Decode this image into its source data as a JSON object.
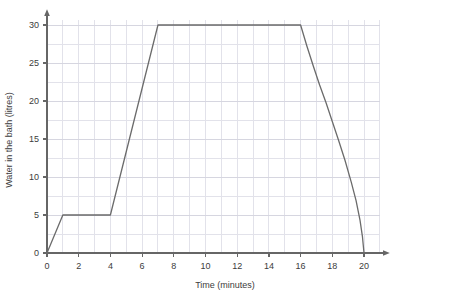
{
  "chart_data": {
    "type": "line",
    "title": "",
    "xlabel": "Time (minutes)",
    "ylabel": "Water in the bath (litres)",
    "xlim": [
      0,
      21
    ],
    "ylim": [
      0,
      31
    ],
    "grid": true,
    "legend": null,
    "xticks": [
      0,
      2,
      4,
      6,
      8,
      10,
      12,
      14,
      16,
      18,
      20
    ],
    "xtick_labels": [
      "0",
      "2",
      "4",
      "6",
      "8",
      "10",
      "12",
      "14",
      "16",
      "18",
      "20"
    ],
    "yticks": [
      0,
      5,
      10,
      15,
      20,
      25,
      30
    ],
    "ytick_labels": [
      "0",
      "5",
      "10",
      "15",
      "20",
      "25",
      "30"
    ],
    "x_minor_step": 1,
    "y_minor_step": 2.5,
    "line_color": "#6b6b6b",
    "grid_color": "#e2e2ea",
    "axis_color": "#666666",
    "series": [
      {
        "name": "Water in the bath",
        "points": [
          [
            0,
            0
          ],
          [
            1,
            5
          ],
          [
            4,
            5
          ],
          [
            7,
            30
          ],
          [
            16,
            30
          ],
          [
            16.4,
            27.2
          ],
          [
            16.8,
            24.6
          ],
          [
            17.2,
            22.1
          ],
          [
            17.6,
            19.8
          ],
          [
            18.0,
            17.3
          ],
          [
            18.4,
            14.8
          ],
          [
            18.8,
            12.2
          ],
          [
            19.2,
            9.3
          ],
          [
            19.5,
            6.9
          ],
          [
            19.75,
            4.3
          ],
          [
            19.9,
            2.2
          ],
          [
            20,
            0
          ]
        ]
      }
    ],
    "annotations": []
  },
  "axes": {
    "x_label_text": "Time (minutes)",
    "y_label_text": "Water in the bath (litres)"
  }
}
